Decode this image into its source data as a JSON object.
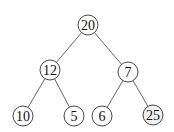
{
  "diagram": {
    "type": "binary-tree",
    "nodes": [
      {
        "id": "n0",
        "label": "20",
        "x": 88,
        "y": 25,
        "shaded": false
      },
      {
        "id": "n1",
        "label": "12",
        "x": 50,
        "y": 70,
        "shaded": false
      },
      {
        "id": "n2",
        "label": "7",
        "x": 128,
        "y": 72,
        "shaded": false
      },
      {
        "id": "n3",
        "label": "10",
        "x": 23,
        "y": 116,
        "shaded": false
      },
      {
        "id": "n4",
        "label": "5",
        "x": 74,
        "y": 116,
        "shaded": false
      },
      {
        "id": "n5",
        "label": "6",
        "x": 102,
        "y": 116,
        "shaded": false
      },
      {
        "id": "n6",
        "label": "25",
        "x": 153,
        "y": 115,
        "shaded": true
      }
    ],
    "edges": [
      [
        "n0",
        "n1"
      ],
      [
        "n0",
        "n2"
      ],
      [
        "n1",
        "n3"
      ],
      [
        "n1",
        "n4"
      ],
      [
        "n2",
        "n5"
      ],
      [
        "n2",
        "n6"
      ]
    ],
    "node_radius": 10,
    "colors": {
      "stroke": "#333333",
      "edge": "#555555",
      "fill": "#ffffff",
      "shaded_fill": "#f0f0f0"
    }
  }
}
